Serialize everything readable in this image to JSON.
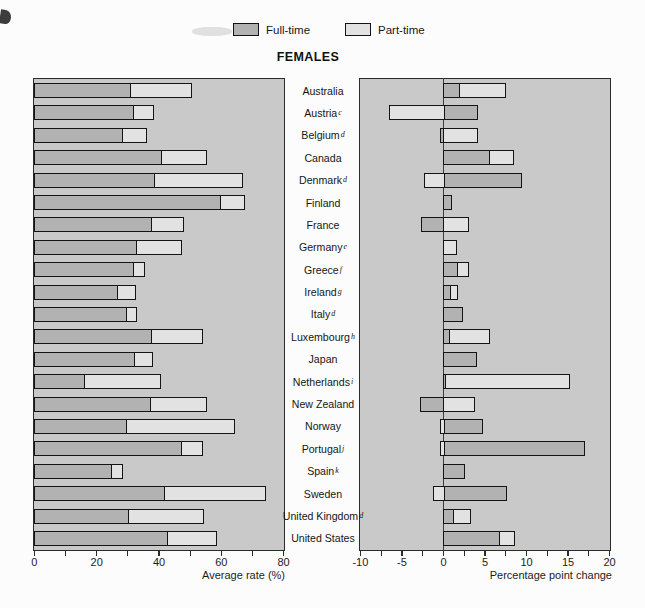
{
  "chart_data": {
    "type": "bar",
    "orientation": "horizontal-stacked",
    "title": "FEMALES",
    "legend": {
      "fulltime_label": "Full-time",
      "parttime_label": "Part-time"
    },
    "colors": {
      "fulltime": "#b2b2b2",
      "parttime": "#e2e2e2",
      "panel_background": "#c9c9c9",
      "outline": "#141414"
    },
    "left_axis": {
      "label": "Average rate (%)",
      "range": [
        0,
        80
      ],
      "major_ticks": [
        0,
        20,
        40,
        60,
        80
      ],
      "tick_labels": [
        "0",
        "20",
        "40",
        "60",
        "80"
      ],
      "minor_step": 10
    },
    "right_axis": {
      "label": "Percentage point change",
      "range": [
        -10,
        20
      ],
      "major_ticks": [
        -10,
        -5,
        0,
        5,
        10,
        15,
        20
      ],
      "tick_labels": [
        "-10",
        "-5",
        "0",
        "5",
        "10",
        "15",
        "20"
      ],
      "minor_step": 2.5
    },
    "series_note": "rate_* shown in left panel (stacked from 0); chg_* shown in right panel (negatives extend left of zero)",
    "countries": [
      {
        "name": "Australia",
        "sup": "",
        "rate_ft": 31.0,
        "rate_pt": 19.5,
        "chg_ft": 2.0,
        "chg_pt": 5.5
      },
      {
        "name": "Austria",
        "sup": "c",
        "rate_ft": 32.0,
        "rate_pt": 6.5,
        "chg_ft": 4.2,
        "chg_pt": -6.5
      },
      {
        "name": "Belgium",
        "sup": "d",
        "rate_ft": 28.5,
        "rate_pt": 7.5,
        "chg_ft": -0.4,
        "chg_pt": 4.2
      },
      {
        "name": "Canada",
        "sup": "",
        "rate_ft": 41.0,
        "rate_pt": 14.5,
        "chg_ft": 5.6,
        "chg_pt": 2.9
      },
      {
        "name": "Denmark",
        "sup": "d",
        "rate_ft": 39.0,
        "rate_pt": 28.0,
        "chg_ft": 9.5,
        "chg_pt": -2.3
      },
      {
        "name": "Finland",
        "sup": "",
        "rate_ft": 60.0,
        "rate_pt": 7.5,
        "chg_ft": 1.0,
        "chg_pt": 0
      },
      {
        "name": "France",
        "sup": "",
        "rate_ft": 38.0,
        "rate_pt": 10.0,
        "chg_ft": -2.7,
        "chg_pt": 3.1
      },
      {
        "name": "Germany",
        "sup": "e",
        "rate_ft": 33.0,
        "rate_pt": 14.5,
        "chg_ft": 0,
        "chg_pt": 1.6
      },
      {
        "name": "Greece",
        "sup": "f",
        "rate_ft": 32.0,
        "rate_pt": 3.5,
        "chg_ft": 1.8,
        "chg_pt": 1.3
      },
      {
        "name": "Ireland",
        "sup": "g",
        "rate_ft": 27.0,
        "rate_pt": 5.5,
        "chg_ft": 0.9,
        "chg_pt": 0.9
      },
      {
        "name": "Italy",
        "sup": "d",
        "rate_ft": 30.0,
        "rate_pt": 3.0,
        "chg_ft": 2.3,
        "chg_pt": 0
      },
      {
        "name": "Luxembourg",
        "sup": "h",
        "rate_ft": 38.0,
        "rate_pt": 16.0,
        "chg_ft": 0.8,
        "chg_pt": 4.8
      },
      {
        "name": "Japan",
        "sup": "",
        "rate_ft": 32.5,
        "rate_pt": 5.5,
        "chg_ft": 4.0,
        "chg_pt": 0
      },
      {
        "name": "Netherlands",
        "sup": "i",
        "rate_ft": 16.5,
        "rate_pt": 24.0,
        "chg_ft": 0.3,
        "chg_pt": 14.9
      },
      {
        "name": "New Zealand",
        "sup": "",
        "rate_ft": 37.5,
        "rate_pt": 18.0,
        "chg_ft": -2.8,
        "chg_pt": 3.8
      },
      {
        "name": "Norway",
        "sup": "",
        "rate_ft": 30.0,
        "rate_pt": 34.5,
        "chg_ft": 4.8,
        "chg_pt": -0.4
      },
      {
        "name": "Portugal",
        "sup": "j",
        "rate_ft": 47.5,
        "rate_pt": 6.5,
        "chg_ft": 17.0,
        "chg_pt": -0.4
      },
      {
        "name": "Spain",
        "sup": "k",
        "rate_ft": 25.0,
        "rate_pt": 3.5,
        "chg_ft": 2.6,
        "chg_pt": 0
      },
      {
        "name": "Sweden",
        "sup": "",
        "rate_ft": 42.0,
        "rate_pt": 32.5,
        "chg_ft": 7.7,
        "chg_pt": -1.2
      },
      {
        "name": "United Kingdom",
        "sup": "d",
        "rate_ft": 30.5,
        "rate_pt": 24.0,
        "chg_ft": 1.3,
        "chg_pt": 2.0
      },
      {
        "name": "United States",
        "sup": "",
        "rate_ft": 43.0,
        "rate_pt": 15.5,
        "chg_ft": 6.9,
        "chg_pt": 1.7
      }
    ]
  }
}
